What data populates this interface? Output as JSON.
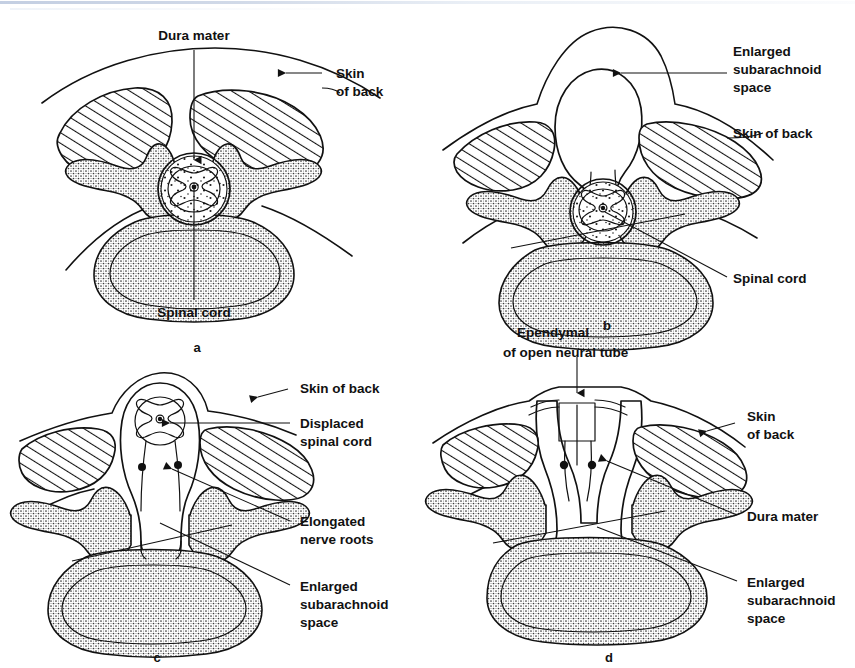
{
  "figure": {
    "background_color": "#ffffff",
    "ink_color": "#111111",
    "panel_count": 4
  },
  "panels": [
    {
      "id": "a",
      "letter": "a",
      "condition": "Normal spinal cord and vertebra",
      "labels": [
        {
          "name": "dura-mater",
          "text": "Dura mater",
          "leader": "vertical arrow down to dura"
        },
        {
          "name": "skin-of-back",
          "text": "Skin\nof back",
          "line1": "Skin",
          "line2": "of back",
          "leader": "arrow left to skin line"
        },
        {
          "name": "spinal-cord",
          "text": "Spinal cord",
          "leader": "vertical line up to cord"
        }
      ]
    },
    {
      "id": "b",
      "letter": "b",
      "condition": "Meningocele",
      "labels": [
        {
          "name": "enlarged-subarachnoid-space",
          "text": "Enlarged\nsubarachnoid\nspace",
          "line1": "Enlarged",
          "line2": "subarachnoid",
          "line3": "space",
          "leader": "horizontal arrow left into sac"
        },
        {
          "name": "skin-of-back",
          "text": "Skin of back",
          "leader": "curve to skin line"
        },
        {
          "name": "spinal-cord",
          "text": "Spinal cord",
          "leader": "diagonal line up to cord"
        }
      ]
    },
    {
      "id": "c",
      "letter": "c",
      "condition": "Myelomeningocele",
      "labels": [
        {
          "name": "skin-of-back",
          "text": "Skin of back",
          "leader": "arrow left to skin line"
        },
        {
          "name": "displaced-spinal-cord",
          "text": "Displaced\nspinal cord",
          "line1": "Displaced",
          "line2": "spinal cord",
          "leader": "horizontal line to cord"
        },
        {
          "name": "elongated-nerve-roots",
          "text": "Elongated\nnerve roots",
          "line1": "Elongated",
          "line2": "nerve roots",
          "leader": "line to nerve root dots"
        },
        {
          "name": "enlarged-subarachnoid-space",
          "text": "Enlarged\nsubarachnoid\nspace",
          "line1": "Enlarged",
          "line2": "subarachnoid",
          "line3": "space",
          "leader": "long diagonal line into sac"
        }
      ]
    },
    {
      "id": "d",
      "letter": "d",
      "condition": "Myeloschisis / open neural tube",
      "labels": [
        {
          "name": "ependymal-of-open-neural-tube",
          "text": "Ependymal\nof open neural tube",
          "line1": "Ependymal",
          "line2": "of open neural tube",
          "leader": "vertical arrow down to neural plate"
        },
        {
          "name": "skin-of-back",
          "text": "Skin\nof back",
          "line1": "Skin",
          "line2": "of back",
          "leader": "arrow left to skin line"
        },
        {
          "name": "dura-mater",
          "text": "Dura mater",
          "leader": "diagonal line to dura"
        },
        {
          "name": "enlarged-subarachnoid-space",
          "text": "Enlarged\nsubarachnoid\nspace",
          "line1": "Enlarged",
          "line2": "subarachnoid",
          "line3": "space",
          "leader": "long diagonal line into sac"
        }
      ]
    }
  ]
}
